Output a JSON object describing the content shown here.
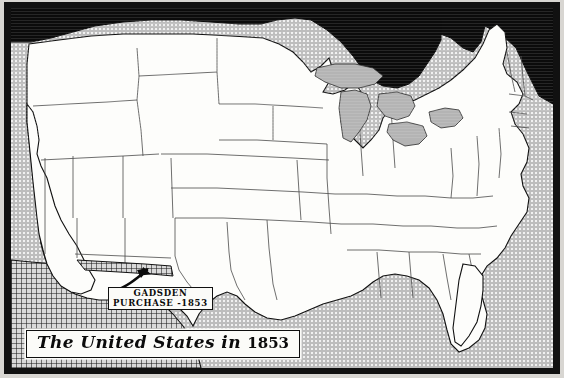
{
  "figure": {
    "kind": "historical-map-scan",
    "title": "The United States in 1853",
    "title_words": {
      "main": "The United States in",
      "year": "1853"
    }
  },
  "annotations": {
    "gadsden": {
      "line1": "GADSDEN",
      "line2": "PURCHASE -1853",
      "arrow_icon": "curved-arrow-icon"
    }
  },
  "regions": {
    "canada": {
      "name": "Canada",
      "fill": "#0b0b0b"
    },
    "mexico": {
      "name": "Mexico",
      "fill": "crosshatch"
    },
    "united_states": {
      "name": "United States",
      "fill": "#fdfdfb"
    },
    "ocean": {
      "name": "Ocean",
      "fill": "#bdbdbd"
    },
    "great_lakes": {
      "name": "Great Lakes",
      "fill": "#b4b4b4"
    }
  },
  "colors": {
    "frame": "#111111",
    "paper": "#d8d6d2",
    "land": "#fdfdfb",
    "water": "#bdbdbd",
    "ink": "#0b0b0b",
    "state_border": "#4a4a4a"
  }
}
